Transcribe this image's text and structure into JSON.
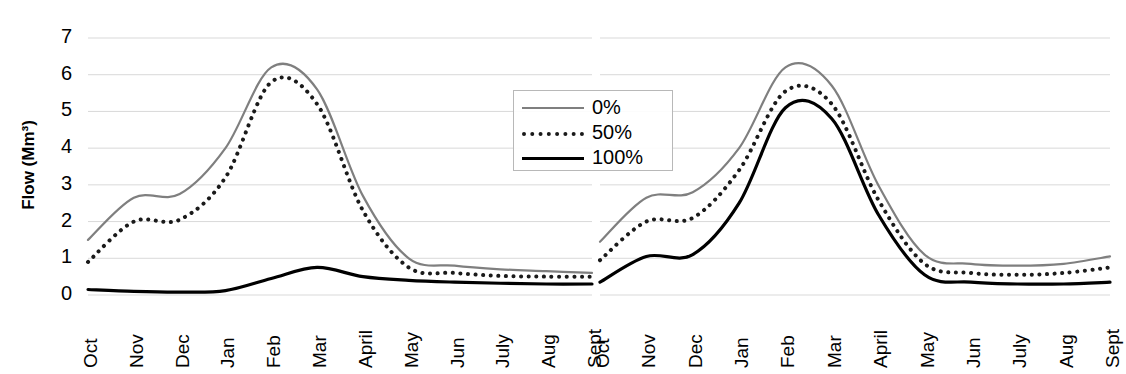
{
  "chart_data": [
    {
      "type": "line",
      "panel": "left",
      "title": "",
      "xlabel": "",
      "ylabel": "Flow (Mm³)",
      "ylim": [
        0,
        7
      ],
      "yticks": [
        0,
        1,
        2,
        3,
        4,
        5,
        6,
        7
      ],
      "grid": true,
      "legend_position": "center-right",
      "categories": [
        "Oct",
        "Nov",
        "Dec",
        "Jan",
        "Feb",
        "Mar",
        "April",
        "May",
        "Jun",
        "July",
        "Aug",
        "Sept"
      ],
      "series": [
        {
          "name": "0%",
          "style": "solid-gray",
          "color": "#7f7f7f",
          "values": [
            1.5,
            2.65,
            2.75,
            4.0,
            6.2,
            5.6,
            2.7,
            1.0,
            0.8,
            0.7,
            0.65,
            0.6
          ]
        },
        {
          "name": "50%",
          "style": "dotted",
          "color": "#1a1a1a",
          "values": [
            0.9,
            2.0,
            2.05,
            3.2,
            5.8,
            5.2,
            2.3,
            0.75,
            0.6,
            0.52,
            0.5,
            0.5
          ]
        },
        {
          "name": "100%",
          "style": "solid-black",
          "color": "#000000",
          "values": [
            0.15,
            0.1,
            0.08,
            0.12,
            0.45,
            0.75,
            0.5,
            0.4,
            0.35,
            0.32,
            0.3,
            0.3
          ]
        }
      ]
    },
    {
      "type": "line",
      "panel": "right",
      "title": "",
      "xlabel": "",
      "ylabel": "",
      "ylim": [
        0,
        7
      ],
      "yticks": [
        0,
        1,
        2,
        3,
        4,
        5,
        6,
        7
      ],
      "grid": true,
      "legend_position": "none",
      "categories": [
        "Oct",
        "Nov",
        "Dec",
        "Jan",
        "Feb",
        "Mar",
        "April",
        "May",
        "Jun",
        "July",
        "Aug",
        "Sept"
      ],
      "series": [
        {
          "name": "0%",
          "style": "solid-gray",
          "color": "#7f7f7f",
          "values": [
            1.45,
            2.65,
            2.8,
            4.0,
            6.2,
            5.7,
            3.0,
            1.1,
            0.85,
            0.8,
            0.85,
            1.05
          ]
        },
        {
          "name": "50%",
          "style": "dotted",
          "color": "#1a1a1a",
          "values": [
            0.95,
            2.0,
            2.1,
            3.4,
            5.55,
            5.2,
            2.6,
            0.85,
            0.6,
            0.55,
            0.6,
            0.75
          ]
        },
        {
          "name": "100%",
          "style": "solid-black",
          "color": "#000000",
          "values": [
            0.35,
            1.05,
            1.1,
            2.5,
            5.1,
            4.8,
            2.2,
            0.55,
            0.35,
            0.3,
            0.3,
            0.35
          ]
        }
      ]
    }
  ],
  "axis": {
    "y_label": "Flow (Mm³)",
    "y_ticks": [
      "0",
      "1",
      "2",
      "3",
      "4",
      "5",
      "6",
      "7"
    ],
    "x_ticks_left": [
      "Oct",
      "Nov",
      "Dec",
      "Jan",
      "Feb",
      "Mar",
      "April",
      "May",
      "Jun",
      "July",
      "Aug",
      "Sept"
    ],
    "x_ticks_right": [
      "Oct",
      "Nov",
      "Dec",
      "Jan",
      "Feb",
      "Mar",
      "April",
      "May",
      "Jun",
      "July",
      "Aug",
      "Sept"
    ]
  },
  "legend": {
    "entries": [
      {
        "label": "0%",
        "style": "solid-gray"
      },
      {
        "label": "50%",
        "style": "dotted"
      },
      {
        "label": "100%",
        "style": "solid-black"
      }
    ]
  },
  "colors": {
    "series_0pct": "#7f7f7f",
    "series_50pct": "#1a1a1a",
    "series_100pct": "#000000",
    "gridline": "#d9d9d9",
    "background": "#ffffff"
  }
}
